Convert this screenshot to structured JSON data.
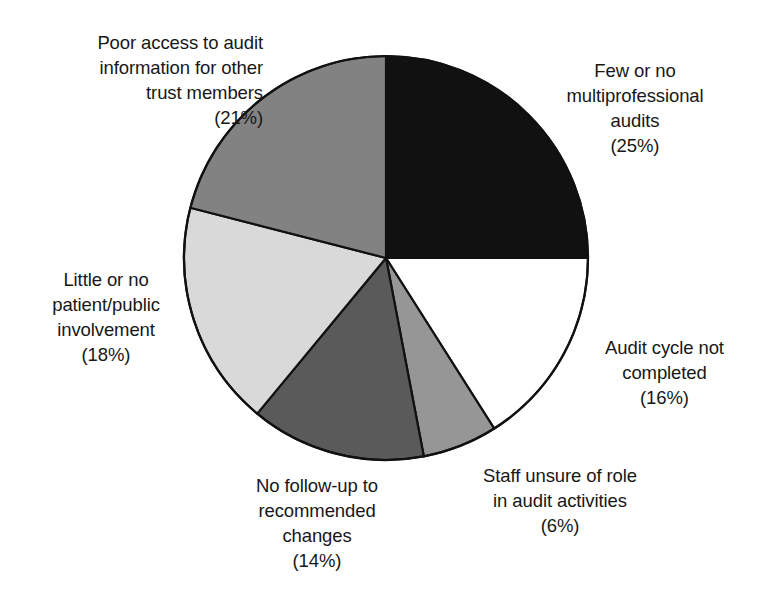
{
  "chart_data": {
    "type": "pie",
    "title": "",
    "subtitle": "",
    "xlabel": "",
    "ylabel": "",
    "legend_position": "none",
    "grid": false,
    "start_angle_deg": 0,
    "direction": "clockwise",
    "units": "%",
    "categories": [
      "Few or no multiprofessional audits",
      "Audit cycle not completed",
      "Staff unsure of role in audit activities",
      "No follow-up to recommended changes",
      "Little or no patient/public involvement",
      "Poor access to audit information for other trust members"
    ],
    "values": [
      25,
      16,
      6,
      14,
      18,
      21
    ],
    "slice_colors": [
      "#111111",
      "#ffffff",
      "#969696",
      "#5a5a5a",
      "#d9d9d9",
      "#828282"
    ],
    "slices": [
      {
        "label": "Few or no multiprofessional audits",
        "label_text": "Few or no\nmultiprofessional\naudits",
        "percent_text": "(25%)",
        "value": 25,
        "color": "#111111"
      },
      {
        "label": "Audit cycle not completed",
        "label_text": "Audit cycle not\ncompleted",
        "percent_text": "(16%)",
        "value": 16,
        "color": "#ffffff"
      },
      {
        "label": "Staff unsure of role in audit activities",
        "label_text": "Staff unsure of role\nin audit activities",
        "percent_text": "(6%)",
        "value": 6,
        "color": "#969696"
      },
      {
        "label": "No follow-up to recommended changes",
        "label_text": "No follow-up to\nrecommended\nchanges",
        "percent_text": "(14%)",
        "value": 14,
        "color": "#5a5a5a"
      },
      {
        "label": "Little or no patient/public involvement",
        "label_text": "Little or no\npatient/public\ninvolvement",
        "percent_text": "(18%)",
        "value": 18,
        "color": "#d9d9d9"
      },
      {
        "label": "Poor access to audit information for other trust members",
        "label_text": "Poor access to audit\ninformation for other\ntrust members",
        "percent_text": "(21%)",
        "value": 21,
        "color": "#828282"
      }
    ]
  },
  "labels": {
    "poor_access": "Poor access to audit\ninformation for other\ntrust members\n(21%)",
    "few_or_no": "Few or no\nmultiprofessional\naudits\n(25%)",
    "little_or_no": "Little or no\npatient/public\ninvolvement\n(18%)",
    "audit_cycle": "Audit cycle not\ncompleted\n(16%)",
    "staff_unsure": "Staff unsure of role\nin audit activities\n(6%)",
    "no_followup": "No follow-up to\nrecommended\nchanges\n(14%)"
  },
  "style": {
    "background": "#ffffff",
    "outline": "#111111",
    "text_color": "#171717"
  }
}
